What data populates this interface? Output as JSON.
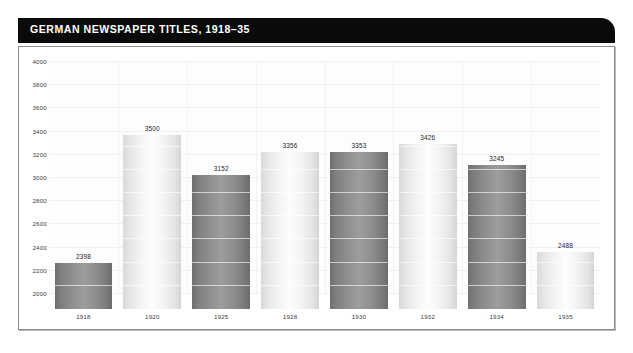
{
  "figure": {
    "title": "GERMAN NEWSPAPER TITLES, 1918–35"
  },
  "chart_data": {
    "type": "bar",
    "title": "GERMAN NEWSPAPER TITLES, 1918–35",
    "xlabel": "",
    "ylabel": "",
    "ylim": [
      2000,
      4000
    ],
    "ytick_step": 200,
    "yticks": [
      "2000",
      "2200",
      "2400",
      "2600",
      "2800",
      "3000",
      "3200",
      "3400",
      "3600",
      "3800",
      "4000"
    ],
    "grid": true,
    "legend": "none",
    "categories": [
      "1918",
      "1920",
      "1925",
      "1928",
      "1930",
      "1932",
      "1934",
      "1935"
    ],
    "values": [
      2398,
      3500,
      3152,
      3356,
      3353,
      3426,
      3245,
      2488
    ],
    "value_labels": [
      "2398",
      "3500",
      "3152",
      "3356",
      "3353",
      "3426",
      "3245",
      "2488"
    ],
    "bar_shades": [
      "dark",
      "light",
      "dark",
      "light",
      "dark",
      "light",
      "dark",
      "light"
    ],
    "colors": {
      "title_bar": "#0a0a0a",
      "title_text": "#ffffff",
      "panel_background": "#ffffff",
      "panel_border": "#8a8a8a",
      "plot_background": "#fdfdfd",
      "gridline": "#f0f0f0",
      "bar_dark": "#8d8d8d",
      "bar_light": "#f0f0f0",
      "tick_text": "#404040"
    }
  }
}
